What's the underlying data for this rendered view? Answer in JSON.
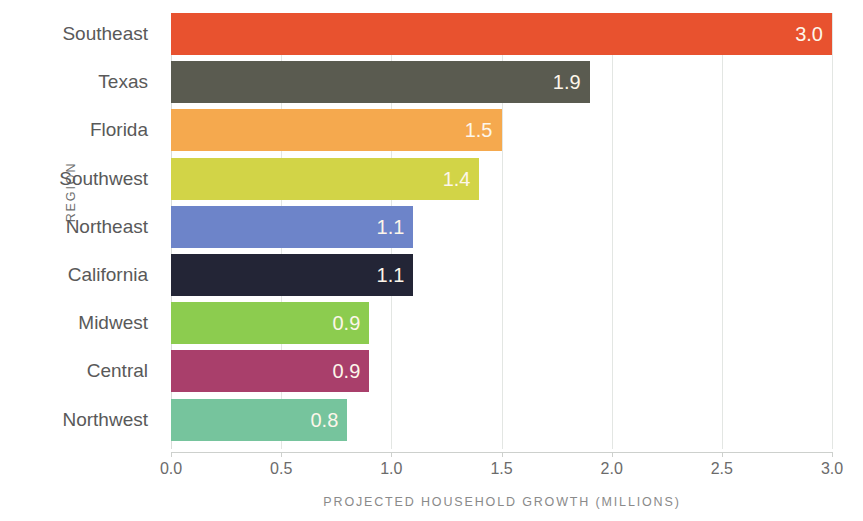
{
  "chart_data": {
    "type": "bar",
    "orientation": "horizontal",
    "title": "",
    "xlabel": "PROJECTED HOUSEHOLD GROWTH (MILLIONS)",
    "ylabel": "REGION",
    "xlim": [
      0.0,
      3.0
    ],
    "grid": true,
    "legend": "none",
    "categories": [
      "Southeast",
      "Texas",
      "Florida",
      "Southwest",
      "Northeast",
      "California",
      "Midwest",
      "Central",
      "Northwest"
    ],
    "values": [
      3.0,
      1.9,
      1.5,
      1.4,
      1.1,
      1.1,
      0.9,
      0.9,
      0.8
    ],
    "value_labels": [
      "3.0",
      "1.9",
      "1.5",
      "1.4",
      "1.1",
      "1.1",
      "0.9",
      "0.9",
      "0.8"
    ],
    "bar_colors": [
      "#E8522F",
      "#5A5B50",
      "#F5A94E",
      "#D2D447",
      "#6D84C9",
      "#232536",
      "#8CCC4F",
      "#A93F6B",
      "#76C49D"
    ],
    "xticks": [
      0.0,
      0.5,
      1.0,
      1.5,
      2.0,
      2.5,
      3.0
    ],
    "xtick_labels": [
      "0.0",
      "0.5",
      "1.0",
      "1.5",
      "2.0",
      "2.5",
      "3.0"
    ],
    "bars": [
      {
        "category": "Southeast",
        "value": 3.0,
        "label": "3.0",
        "color": "#E8522F"
      },
      {
        "category": "Texas",
        "value": 1.9,
        "label": "1.9",
        "color": "#5A5B50"
      },
      {
        "category": "Florida",
        "value": 1.5,
        "label": "1.5",
        "color": "#F5A94E"
      },
      {
        "category": "Southwest",
        "value": 1.4,
        "label": "1.4",
        "color": "#D2D447"
      },
      {
        "category": "Northeast",
        "value": 1.1,
        "label": "1.1",
        "color": "#6D84C9"
      },
      {
        "category": "California",
        "value": 1.1,
        "label": "1.1",
        "color": "#232536"
      },
      {
        "category": "Midwest",
        "value": 0.9,
        "label": "0.9",
        "color": "#8CCC4F"
      },
      {
        "category": "Central",
        "value": 0.9,
        "label": "0.9",
        "color": "#A93F6B"
      },
      {
        "category": "Northwest",
        "value": 0.8,
        "label": "0.8",
        "color": "#76C49D"
      }
    ]
  },
  "style": {
    "gridline_color": "#e3e6e3",
    "axis_color": "#cdd0cd",
    "category_label_color": "#595959",
    "tick_label_color": "#6b6b6b",
    "axis_title_color": "#8a8a8a",
    "value_label_color": "#fdf6ea",
    "background": "#ffffff"
  }
}
